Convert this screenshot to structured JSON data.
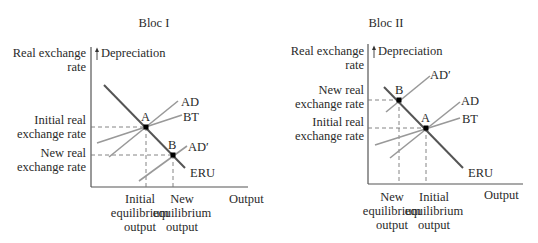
{
  "blocs": [
    {
      "title": "Bloc I",
      "y_axis_label_line1": "Real exchange",
      "y_axis_label_line2": "rate",
      "arrow_label": "Depreciation",
      "x_axis_label": "Output",
      "upper_rate_line1": "Initial real",
      "upper_rate_line2": "exchange rate",
      "lower_rate_line1": "New real",
      "lower_rate_line2": "exchange rate",
      "left_output_line1": "Initial",
      "left_output_line2": "equilibrium",
      "left_output_line3": "output",
      "right_output_line1": "New",
      "right_output_line2": "equilibrium",
      "right_output_line3": "output",
      "curves": {
        "ad": "AD",
        "bt": "BT",
        "ad_prime": "AD′",
        "eru": "ERU"
      },
      "points": {
        "a": "A",
        "b": "B"
      }
    },
    {
      "title": "Bloc II",
      "y_axis_label_line1": "Real exchange",
      "y_axis_label_line2": "rate",
      "arrow_label": "Depreciation",
      "x_axis_label": "Output",
      "upper_rate_line1": "New real",
      "upper_rate_line2": "exchange rate",
      "lower_rate_line1": "Initial real",
      "lower_rate_line2": "exchange rate",
      "left_output_line1": "New",
      "left_output_line2": "equilibrium",
      "left_output_line3": "output",
      "right_output_line1": "Initial",
      "right_output_line2": "equilibrium",
      "right_output_line3": "output",
      "curves": {
        "ad": "AD",
        "bt": "BT",
        "ad_prime": "AD′",
        "eru": "ERU"
      },
      "points": {
        "a": "A",
        "b": "B"
      }
    }
  ]
}
